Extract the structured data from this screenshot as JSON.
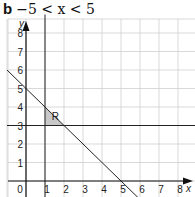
{
  "header": {
    "part_label": "b",
    "condition": "−5 < x < 5"
  },
  "chart_data": {
    "type": "line",
    "xlabel": "x",
    "ylabel": "y",
    "xlim": [
      -0.3,
      9
    ],
    "ylim": [
      -0.8,
      8.6
    ],
    "grid": true,
    "x_ticks": [
      "0",
      "1",
      "2",
      "3",
      "4",
      "5",
      "6",
      "7",
      "8"
    ],
    "y_ticks": [
      "1",
      "2",
      "3",
      "4",
      "5",
      "6",
      "7",
      "8"
    ],
    "series": [
      {
        "name": "x + y = 5",
        "type": "line",
        "x": [
          -1,
          6
        ],
        "y": [
          6,
          -1
        ]
      },
      {
        "name": "y = 3",
        "type": "line",
        "x": [
          -1,
          9
        ],
        "y": [
          3,
          3
        ]
      },
      {
        "name": "x = 1",
        "type": "line",
        "x": [
          1,
          1
        ],
        "y": [
          -1,
          9
        ]
      }
    ],
    "regions": [
      {
        "label": "R",
        "vertices": [
          [
            1,
            3
          ],
          [
            1,
            4
          ],
          [
            2,
            3
          ]
        ],
        "fill": "#c8c8c8"
      }
    ],
    "annotations": [
      {
        "text": "R",
        "x": 1.35,
        "y": 3.3
      }
    ]
  },
  "labels": {
    "x_axis": "x",
    "y_axis": "y",
    "region": "R",
    "origin": "0"
  }
}
